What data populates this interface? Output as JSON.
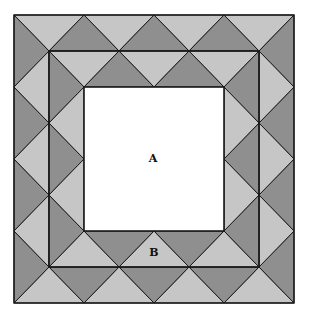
{
  "figure": {
    "type": "quilt-border-pattern",
    "grid": {
      "x0": 14,
      "y0": 15,
      "ux": 35,
      "uy": 36,
      "n": 8
    },
    "colors": {
      "dark": "#8f8f8f",
      "light": "#c6c6c6",
      "line": "#1a1a1a",
      "center": "#ffffff"
    },
    "labels": [
      {
        "id": "A",
        "text": "A",
        "x": 153,
        "y": 158
      },
      {
        "id": "B",
        "text": "B",
        "x": 154,
        "y": 252
      }
    ],
    "regions": {
      "outer_square": [
        0,
        0,
        8,
        8
      ],
      "middle_square": [
        1,
        1,
        7,
        7
      ],
      "inner_square": [
        2,
        2,
        6,
        6
      ]
    }
  }
}
